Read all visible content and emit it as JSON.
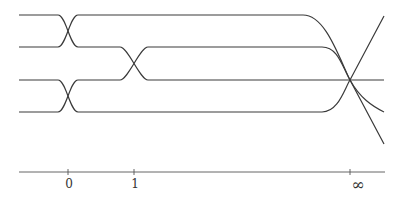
{
  "diagram": {
    "stroke_color": "#3a3a3a",
    "strands": [
      {
        "id": "s1",
        "d": "M19,15 L58,15 C66,15 70,47 78,47 L84,47 L120,47 C128,47 140,80 148,80 L355,80 L384,80"
      },
      {
        "id": "s2",
        "d": "M19,47 L58,47 C66,47 70,15 78,15 L303,15 C325,15 338,55 350,80 L384,144"
      },
      {
        "id": "s3",
        "d": "M19,80 L58,80 C66,80 70,112 78,112 L322,112 C338,112 344,90 350,80 L384,16"
      },
      {
        "id": "s4",
        "d": "M19,112 L58,112 C66,112 70,80 78,80 L120,80 C128,80 140,47 148,47 L322,47 C338,47 342,66 350,80 C360,98 372,106 384,112"
      }
    ],
    "axis": {
      "x_start": 19,
      "x_end": 385,
      "y": 172,
      "ticks": [
        {
          "x": 68,
          "label": "0"
        },
        {
          "x": 134,
          "label": "1"
        },
        {
          "x": 350,
          "label": "∞"
        }
      ]
    }
  }
}
